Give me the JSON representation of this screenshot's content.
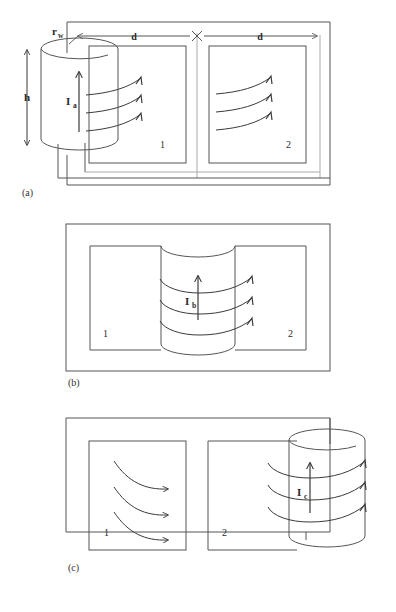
{
  "figure": {
    "caption_a": "(a)",
    "caption_b": "(b)",
    "caption_c": "(c)"
  },
  "panel_a": {
    "label": "(a)",
    "height_label": "h",
    "radius_label": "r",
    "radius_sub": "w",
    "current_label": "I",
    "current_sub": "a",
    "distance_left": "d",
    "distance_right": "d",
    "loop_1": "1",
    "loop_2": "2",
    "center_marker": "x"
  },
  "panel_b": {
    "label": "(b)",
    "current_label": "I",
    "current_sub": "b",
    "loop_1": "1",
    "loop_2": "2"
  },
  "panel_c": {
    "label": "(c)",
    "current_label": "I",
    "current_sub": "c",
    "loop_1": "1",
    "loop_2": "2"
  },
  "colors": {
    "background": "#ffffff",
    "line": "#555555",
    "line_dark": "#3a3a3a",
    "text": "#2b2b2b",
    "divider": "#aaaaaa"
  }
}
